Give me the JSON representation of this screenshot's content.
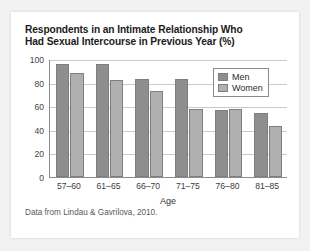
{
  "figure": {
    "title_line_1": "Respondents in an Intimate Relationship Who",
    "title_line_2": "Had Sexual Intercourse in Previous Year (%)",
    "source_note": "Data from Lindau & Gavrilova, 2010."
  },
  "colors": {
    "men_bar": "#8e8e8e",
    "women_bar": "#b0b0b0",
    "axis": "#8c8c8c",
    "gridline": "#c9c9c9",
    "card_background": "#ffffff",
    "page_background": "#f2f2f2"
  },
  "chart_data": {
    "type": "bar",
    "title": "Respondents in an Intimate Relationship Who Had Sexual Intercourse in Previous Year (%)",
    "xlabel": "Age",
    "ylabel": "",
    "categories": [
      "57–60",
      "61–65",
      "66–70",
      "71–75",
      "76–80",
      "81–85"
    ],
    "series": [
      {
        "name": "Men",
        "values": [
          96,
          96,
          83,
          83,
          57,
          54
        ]
      },
      {
        "name": "Women",
        "values": [
          88,
          82,
          73,
          58,
          58,
          43
        ]
      }
    ],
    "ylim": [
      0,
      100
    ],
    "yticks": [
      0,
      20,
      40,
      60,
      80,
      100
    ],
    "ytick_labels": [
      "0",
      "20",
      "40",
      "60",
      "80",
      "100"
    ],
    "grid": true,
    "legend_position": "top-right",
    "legend_entries": [
      "Men",
      "Women"
    ]
  }
}
